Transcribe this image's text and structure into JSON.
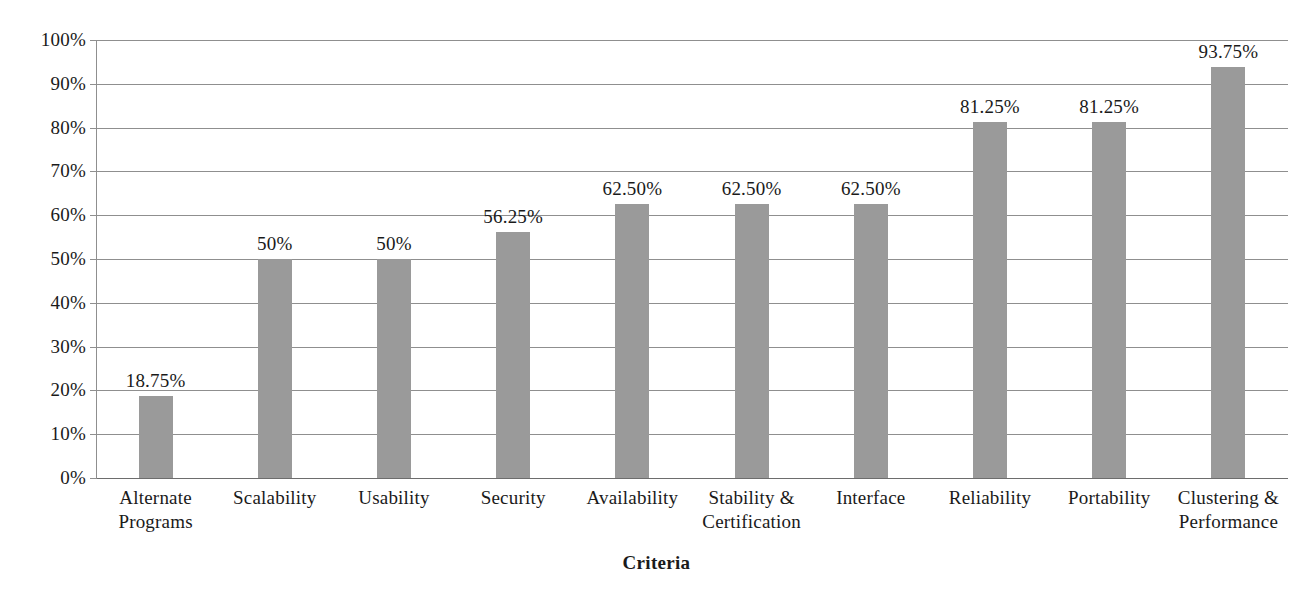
{
  "chart_data": {
    "type": "bar",
    "title": "",
    "xlabel": "Criteria",
    "ylabel": "",
    "ylim": [
      0,
      100
    ],
    "grid": true,
    "legend": "none",
    "bar_color": "#9a9a9a",
    "gridline_color": "#8f8f8f",
    "axis_color": "#8f8f8f",
    "background": "#ffffff",
    "categories": [
      "Alternate Programs",
      "Scalability",
      "Usability",
      "Security",
      "Availability",
      "Stability & Certification",
      "Interface",
      "Reliability",
      "Portability",
      "Clustering & Performance"
    ],
    "category_lines": [
      [
        "Alternate",
        "Programs"
      ],
      [
        "Scalability"
      ],
      [
        "Usability"
      ],
      [
        "Security"
      ],
      [
        "Availability"
      ],
      [
        "Stability &",
        "Certification"
      ],
      [
        "Interface"
      ],
      [
        "Reliability"
      ],
      [
        "Portability"
      ],
      [
        "Clustering &",
        "Performance"
      ]
    ],
    "values": [
      18.75,
      50,
      50,
      56.25,
      62.5,
      62.5,
      62.5,
      81.25,
      81.25,
      93.75
    ],
    "data_labels": [
      "18.75%",
      "50%",
      "50%",
      "56.25%",
      "62.50%",
      "62.50%",
      "62.50%",
      "81.25%",
      "81.25%",
      "93.75%"
    ],
    "ytick_values": [
      0,
      10,
      20,
      30,
      40,
      50,
      60,
      70,
      80,
      90,
      100
    ],
    "ytick_labels": [
      "0%",
      "10%",
      "20%",
      "30%",
      "40%",
      "50%",
      "60%",
      "70%",
      "80%",
      "90%",
      "100%"
    ]
  }
}
